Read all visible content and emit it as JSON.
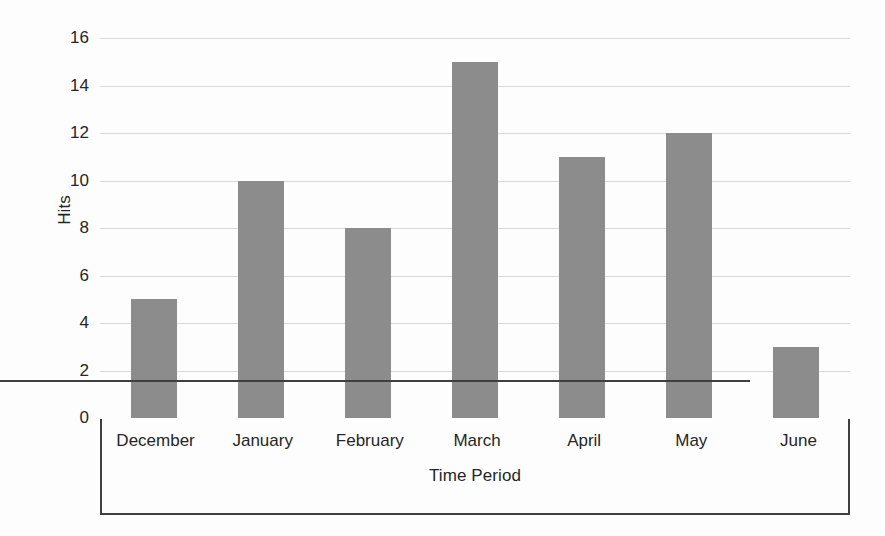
{
  "chart_data": {
    "type": "bar",
    "title": "",
    "xlabel": "Time Period",
    "ylabel": "Hits",
    "categories": [
      "December",
      "January",
      "February",
      "March",
      "April",
      "May",
      "June"
    ],
    "values": [
      5,
      10,
      8,
      15,
      11,
      12,
      3
    ],
    "ylim": [
      0,
      16
    ],
    "ytick_labels": [
      "16",
      "14",
      "12",
      "10",
      "8",
      "6",
      "4",
      "2",
      "0"
    ],
    "ytick_values": [
      16,
      14,
      12,
      10,
      8,
      6,
      4,
      2,
      0
    ],
    "ytick_step": 2,
    "grid": true,
    "grid_axis": "y",
    "legend": false,
    "bar_color": "#8c8c8c",
    "gridline_color": "#d9d9d9",
    "axis_color": "#3f3f3f",
    "text_color": "#262626",
    "background_color": "#fdfdfd"
  }
}
